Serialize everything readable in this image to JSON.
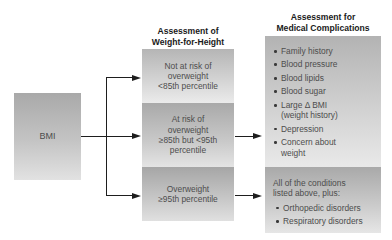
{
  "headings": {
    "weight_for_height_line1": "Assessment of",
    "weight_for_height_line2": "Weight-for-Height",
    "medical_line1": "Assessment for",
    "medical_line2": "Medical Complications"
  },
  "source_box": {
    "label": "BMI"
  },
  "weight_categories": [
    {
      "lines": [
        "Not at risk of",
        "overweight",
        "<85th percentile"
      ]
    },
    {
      "lines": [
        "At risk of",
        "overweight",
        "≥85th but <95th",
        "percentile"
      ]
    },
    {
      "lines": [
        "Overweight",
        "≥95th percentile"
      ]
    }
  ],
  "medical_complications": {
    "at_risk_items": [
      "Family history",
      "Blood pressure",
      "Blood lipids",
      "Blood sugar",
      "Large Δ  BMI (weight history)",
      "Depression",
      "Concern about weight"
    ],
    "overweight_intro": "All of the conditions listed above, plus:",
    "overweight_items": [
      "Orthopedic disorders",
      "Respiratory disorders"
    ]
  },
  "flow": [
    {
      "from": "BMI",
      "to": "Not at risk of overweight <85th percentile"
    },
    {
      "from": "BMI",
      "to": "At risk of overweight ≥85th but <95th percentile"
    },
    {
      "from": "BMI",
      "to": "Overweight ≥95th percentile"
    },
    {
      "from": "At risk of overweight ≥85th but <95th percentile",
      "to": "Assessment for Medical Complications list"
    },
    {
      "from": "Overweight ≥95th percentile",
      "to": "All of the conditions listed above, plus"
    }
  ],
  "colors": {
    "box_fill_dark": "#a9a9a9",
    "box_fill_light": "#e6e6e6",
    "arrow": "#1e1e1e",
    "heading_text": "#1a1a1a",
    "body_text": "#4d4d4d"
  }
}
